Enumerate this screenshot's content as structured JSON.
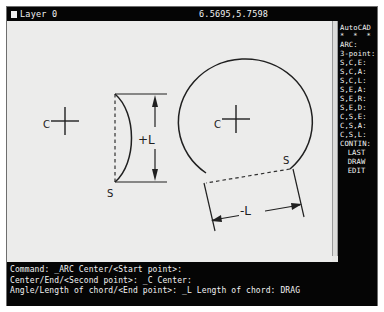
{
  "statusbar": {
    "layer_label": "Layer 0",
    "coordinates": "6.5695,5.7598"
  },
  "sidemenu": {
    "title": "AutoCAD",
    "stars": "* * * *",
    "command_header": "ARC:",
    "items": [
      "3-point:",
      "S,C,E:",
      "S,C,A:",
      "S,C,L:",
      "S,E,A:",
      "S,E,R:",
      "S,E,D:",
      "C,S,E:",
      "C,S,A:",
      "C,S,L:",
      "CONTIN:"
    ],
    "footer_items": [
      "LAST",
      "DRAW",
      "EDIT"
    ]
  },
  "command_lines": [
    "Command: _ARC Center/<Start point>:",
    "Center/End/<Second point>: _C Center:",
    "Angle/Length of chord/<End point>: _L Length of chord: DRAG"
  ],
  "drawing": {
    "left_figure": {
      "center_label": "C",
      "start_label": "S",
      "dimension_label": "+L"
    },
    "right_figure": {
      "center_label": "C",
      "start_label": "S",
      "dimension_label": "-L"
    }
  },
  "colors": {
    "screen_background": "#ececeb",
    "panel_background": "#050505",
    "panel_text": "#f2f2f2",
    "ink": "#202020"
  }
}
